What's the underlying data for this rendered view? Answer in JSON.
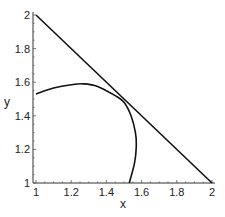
{
  "chart_data": {
    "type": "line",
    "title": "",
    "xlabel": "x",
    "ylabel": "y",
    "xlim": [
      1,
      2
    ],
    "ylim": [
      1,
      2
    ],
    "xticks": [
      "1",
      "1.2",
      "1.4",
      "1.6",
      "1.8",
      "2"
    ],
    "yticks": [
      "1",
      "1.2",
      "1.4",
      "1.6",
      "1.8",
      "2"
    ],
    "grid": false,
    "legend": null,
    "series": [
      {
        "name": "line",
        "points": [
          [
            1,
            2
          ],
          [
            2,
            1
          ]
        ]
      },
      {
        "name": "curve",
        "points": [
          [
            1.0,
            1.53
          ],
          [
            1.1,
            1.565
          ],
          [
            1.2,
            1.585
          ],
          [
            1.27,
            1.59
          ],
          [
            1.35,
            1.575
          ],
          [
            1.45,
            1.52
          ],
          [
            1.5,
            1.48
          ],
          [
            1.54,
            1.4
          ],
          [
            1.565,
            1.3
          ],
          [
            1.57,
            1.22
          ],
          [
            1.56,
            1.12
          ],
          [
            1.53,
            1.0
          ]
        ]
      }
    ]
  }
}
